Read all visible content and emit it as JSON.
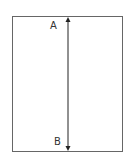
{
  "diagram": {
    "labels": {
      "top": "A",
      "bottom": "B"
    },
    "colors": {
      "stroke": "#555555",
      "arrow": "#222222"
    }
  }
}
